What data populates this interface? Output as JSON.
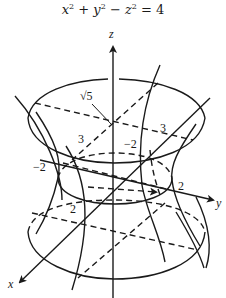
{
  "title": {
    "equation_parts": {
      "x": "x",
      "x_exp": "2",
      "plus": " + ",
      "y": "y",
      "y_exp": "2",
      "minus": " − ",
      "z": "z",
      "z_exp": "2",
      "equals": " = 4"
    },
    "equation": "x² + y² − z² = 4"
  },
  "axes": {
    "x_label": "x",
    "y_label": "y",
    "z_label": "z"
  },
  "labels": {
    "sqrt5": "√5",
    "top_x_3": "3",
    "top_y_3": "3",
    "top_y_neg2": "−2",
    "waist_x_neg2": "−2",
    "waist_y_2": "2",
    "waist_x_2": "2"
  },
  "colors": {
    "ink": "#1a1a1a",
    "background": "#ffffff"
  },
  "surface": {
    "name": "hyperboloid of one sheet",
    "waist_radius": 2,
    "cross_section_radius_at_z_plus_minus_1": "√5"
  }
}
